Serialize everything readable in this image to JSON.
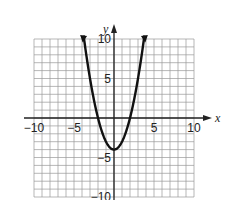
{
  "chart_data": {
    "type": "line",
    "title": "",
    "function": "y = x^2 - 4",
    "xlabel": "x",
    "ylabel": "y",
    "xlim": [
      -10,
      10
    ],
    "ylim": [
      -10,
      10
    ],
    "grid": true,
    "grid_step": 1,
    "x_tick_labels": [
      "-10",
      "-5",
      "5",
      "10"
    ],
    "y_tick_labels": [
      "10",
      "5",
      "-5",
      "-10"
    ],
    "x_ticks": [
      -10,
      -5,
      5,
      10
    ],
    "y_ticks": [
      10,
      5,
      -5,
      -10
    ],
    "series": [
      {
        "name": "parabola",
        "x": [
          -3.74,
          -3,
          -2,
          -1,
          0,
          1,
          2,
          3,
          3.74
        ],
        "y": [
          10,
          5,
          0,
          -3,
          -4,
          -3,
          0,
          5,
          10
        ],
        "arrows_at_ends": true
      }
    ],
    "vertex": [
      0,
      -4
    ],
    "x_intercepts": [
      -2,
      2
    ],
    "legend": null
  },
  "colors": {
    "grid": "#9a9a9a",
    "axis": "#222222",
    "curve": "#111111",
    "background": "#ffffff"
  }
}
